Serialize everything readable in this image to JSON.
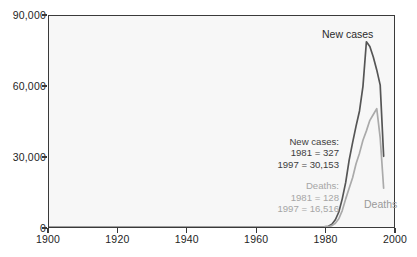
{
  "chart_data": {
    "type": "line",
    "title": "",
    "xlabel": "",
    "ylabel": "",
    "xlim": [
      1900,
      2000
    ],
    "ylim": [
      0,
      90000
    ],
    "grid": false,
    "legend_position": "inline-labels",
    "x_ticks": [
      "1900",
      "1920",
      "1940",
      "1960",
      "1980",
      "2000"
    ],
    "x_tick_values": [
      1900,
      1920,
      1940,
      1960,
      1980,
      2000
    ],
    "y_ticks": [
      "0",
      "30,000",
      "60,000",
      "90,000"
    ],
    "y_tick_values": [
      0,
      30000,
      60000,
      90000
    ],
    "series": [
      {
        "name": "New cases",
        "color": "#555555",
        "x": [
          1900,
          1975,
          1979,
          1981,
          1982,
          1983,
          1984,
          1985,
          1986,
          1987,
          1988,
          1989,
          1990,
          1991,
          1992,
          1993,
          1994,
          1995,
          1996,
          1997
        ],
        "values": [
          0,
          0,
          0,
          327,
          1200,
          3100,
          6400,
          12000,
          19000,
          28500,
          36000,
          43000,
          49500,
          60000,
          79000,
          77000,
          72500,
          67000,
          60500,
          30153
        ]
      },
      {
        "name": "Deaths",
        "color": "#aaaaaa",
        "x": [
          1900,
          1975,
          1979,
          1981,
          1982,
          1983,
          1984,
          1985,
          1986,
          1987,
          1988,
          1989,
          1990,
          1991,
          1992,
          1993,
          1994,
          1995,
          1996,
          1997
        ],
        "values": [
          0,
          0,
          0,
          128,
          600,
          1600,
          3500,
          7000,
          12000,
          16500,
          21000,
          27000,
          31500,
          37000,
          41000,
          45500,
          48000,
          50500,
          38000,
          16516
        ]
      }
    ],
    "annotations": {
      "new_cases": {
        "heading": "New cases:",
        "lines": [
          "1981  =  327",
          "1997  =  30,153"
        ]
      },
      "deaths": {
        "heading": "Deaths:",
        "lines": [
          "1981  =  128",
          "1997  =  16,516"
        ]
      }
    },
    "inline_labels": {
      "new_cases": "New cases",
      "deaths": "Deaths"
    }
  }
}
